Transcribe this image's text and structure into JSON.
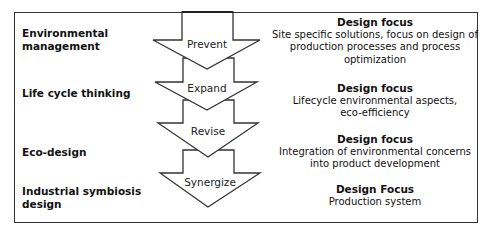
{
  "diagram": {
    "stages": [
      {
        "approach": "Environmental\nmanagement",
        "approach_line1": "Environmental",
        "approach_line2": "management",
        "arrow_label": "Prevent",
        "focus_title": "Design focus",
        "focus_desc_line1": "Site specific solutions, focus on design of",
        "focus_desc_line2": "production processes and process",
        "focus_desc_line3": "optimization"
      },
      {
        "approach_line1": "Life cycle thinking",
        "arrow_label": "Expand",
        "focus_title": "Design focus",
        "focus_desc_line1": "Lifecycle environmental aspects,",
        "focus_desc_line2": "eco-efficiency"
      },
      {
        "approach_line1": "Eco-design",
        "arrow_label": "Revise",
        "focus_title": "Design focus",
        "focus_desc_line1": "Integration of environmental concerns",
        "focus_desc_line2": "into product development"
      },
      {
        "approach_line1": "Industrial symbiosis",
        "approach_line2": "design",
        "arrow_label": "Synergize",
        "focus_title": "Design Focus",
        "focus_desc_line1": "Production system"
      }
    ],
    "colors": {
      "stroke": "#333333",
      "fill": "#ffffff",
      "text": "#111111"
    }
  }
}
